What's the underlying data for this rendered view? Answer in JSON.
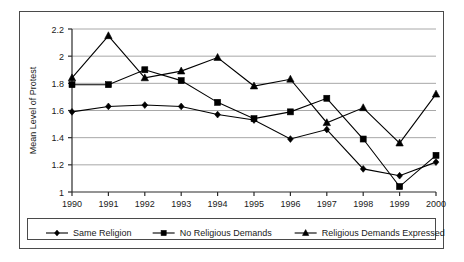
{
  "figure": {
    "background_color": "#ffffff",
    "frame_color": "#4a4a4a",
    "series_color": "#000000",
    "gridline_color": "#a8a8a8"
  },
  "chart_data": {
    "type": "line",
    "title": "",
    "subtitle": "",
    "xlabel": "",
    "ylabel": "Mean Level of Protest",
    "categories": [
      "1990",
      "1991",
      "1992",
      "1993",
      "1994",
      "1995",
      "1996",
      "1997",
      "1998",
      "1999",
      "2000"
    ],
    "x": [
      1990,
      1991,
      1992,
      1993,
      1994,
      1995,
      1996,
      1997,
      1998,
      1999,
      2000
    ],
    "ylim": [
      1,
      2.2
    ],
    "yticks": [
      1,
      1.2,
      1.4,
      1.6,
      1.8,
      2,
      2.2
    ],
    "ytick_labels": [
      "1",
      "1.2",
      "1.4",
      "1.6",
      "1.8",
      "2",
      "2.2"
    ],
    "grid": "horizontal",
    "legend_position": "bottom",
    "series": [
      {
        "name": "Same Religion",
        "marker": "diamond",
        "values": [
          1.59,
          1.63,
          1.64,
          1.63,
          1.57,
          1.53,
          1.39,
          1.46,
          1.17,
          1.12,
          1.22
        ]
      },
      {
        "name": "No Religious Demands",
        "marker": "square",
        "values": [
          1.79,
          1.79,
          1.9,
          1.82,
          1.66,
          1.54,
          1.59,
          1.69,
          1.39,
          1.04,
          1.27
        ]
      },
      {
        "name": "Religious Demands Expressed",
        "marker": "triangle",
        "values": [
          1.84,
          2.15,
          1.84,
          1.89,
          1.99,
          1.78,
          1.83,
          1.51,
          1.62,
          1.36,
          1.72
        ]
      }
    ]
  },
  "legend": {
    "items": [
      {
        "label": "Same Religion",
        "marker": "diamond"
      },
      {
        "label": "No Religious Demands",
        "marker": "square"
      },
      {
        "label": "Religious Demands Expressed",
        "marker": "triangle"
      }
    ]
  }
}
